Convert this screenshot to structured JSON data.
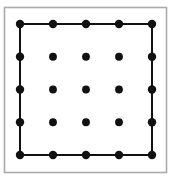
{
  "figure": {
    "canvas": {
      "width": 171,
      "height": 180,
      "background": "#ffffff"
    },
    "outer_frame": {
      "name": "outer-frame",
      "x": 4.5,
      "y": 7.5,
      "width": 162,
      "height": 165,
      "stroke": "#aaaaaa",
      "stroke_width": 1.6,
      "fill": "#ffffff"
    },
    "grid": {
      "rows": 5,
      "cols": 5,
      "x_start": 20,
      "y_start": 24,
      "x_spacing": 33,
      "y_spacing": 32.75,
      "node_count": 25,
      "boundary_node_count": 16,
      "interior_node_count": 9
    },
    "node_style": {
      "radius": 4.2,
      "interior_radius": 3.9,
      "fill": "#111111",
      "stroke": "none"
    },
    "edge_style": {
      "stroke": "#111111",
      "stroke_width": 2.0,
      "description": "perimeter cycle only"
    },
    "nodes": [
      {
        "id": "n-0-0",
        "row": 0,
        "col": 0,
        "x": 20,
        "y": 24,
        "boundary": true
      },
      {
        "id": "n-0-1",
        "row": 0,
        "col": 1,
        "x": 53,
        "y": 24,
        "boundary": true
      },
      {
        "id": "n-0-2",
        "row": 0,
        "col": 2,
        "x": 86,
        "y": 24,
        "boundary": true
      },
      {
        "id": "n-0-3",
        "row": 0,
        "col": 3,
        "x": 119,
        "y": 24,
        "boundary": true
      },
      {
        "id": "n-0-4",
        "row": 0,
        "col": 4,
        "x": 152,
        "y": 24,
        "boundary": true
      },
      {
        "id": "n-1-0",
        "row": 1,
        "col": 0,
        "x": 20,
        "y": 56.75,
        "boundary": true
      },
      {
        "id": "n-1-1",
        "row": 1,
        "col": 1,
        "x": 53,
        "y": 56.75,
        "boundary": false
      },
      {
        "id": "n-1-2",
        "row": 1,
        "col": 2,
        "x": 86,
        "y": 56.75,
        "boundary": false
      },
      {
        "id": "n-1-3",
        "row": 1,
        "col": 3,
        "x": 119,
        "y": 56.75,
        "boundary": false
      },
      {
        "id": "n-1-4",
        "row": 1,
        "col": 4,
        "x": 152,
        "y": 56.75,
        "boundary": true
      },
      {
        "id": "n-2-0",
        "row": 2,
        "col": 0,
        "x": 20,
        "y": 89.5,
        "boundary": true
      },
      {
        "id": "n-2-1",
        "row": 2,
        "col": 1,
        "x": 53,
        "y": 89.5,
        "boundary": false
      },
      {
        "id": "n-2-2",
        "row": 2,
        "col": 2,
        "x": 86,
        "y": 89.5,
        "boundary": false
      },
      {
        "id": "n-2-3",
        "row": 2,
        "col": 3,
        "x": 119,
        "y": 89.5,
        "boundary": false
      },
      {
        "id": "n-2-4",
        "row": 2,
        "col": 4,
        "x": 152,
        "y": 89.5,
        "boundary": true
      },
      {
        "id": "n-3-0",
        "row": 3,
        "col": 0,
        "x": 20,
        "y": 122.25,
        "boundary": true
      },
      {
        "id": "n-3-1",
        "row": 3,
        "col": 1,
        "x": 53,
        "y": 122.25,
        "boundary": false
      },
      {
        "id": "n-3-2",
        "row": 3,
        "col": 2,
        "x": 86,
        "y": 122.25,
        "boundary": false
      },
      {
        "id": "n-3-3",
        "row": 3,
        "col": 3,
        "x": 119,
        "y": 122.25,
        "boundary": false
      },
      {
        "id": "n-3-4",
        "row": 3,
        "col": 4,
        "x": 152,
        "y": 122.25,
        "boundary": true
      },
      {
        "id": "n-4-0",
        "row": 4,
        "col": 0,
        "x": 20,
        "y": 155,
        "boundary": true
      },
      {
        "id": "n-4-1",
        "row": 4,
        "col": 1,
        "x": 53,
        "y": 155,
        "boundary": true
      },
      {
        "id": "n-4-2",
        "row": 4,
        "col": 2,
        "x": 86,
        "y": 155,
        "boundary": true
      },
      {
        "id": "n-4-3",
        "row": 4,
        "col": 3,
        "x": 119,
        "y": 155,
        "boundary": true
      },
      {
        "id": "n-4-4",
        "row": 4,
        "col": 4,
        "x": 152,
        "y": 155,
        "boundary": true
      }
    ],
    "edges": [
      {
        "id": "e-top",
        "from": "n-0-0",
        "to": "n-0-4",
        "x1": 20,
        "y1": 24,
        "x2": 152,
        "y2": 24
      },
      {
        "id": "e-right",
        "from": "n-0-4",
        "to": "n-4-4",
        "x1": 152,
        "y1": 24,
        "x2": 152,
        "y2": 155
      },
      {
        "id": "e-bottom",
        "from": "n-4-4",
        "to": "n-4-0",
        "x1": 152,
        "y1": 155,
        "x2": 20,
        "y2": 155
      },
      {
        "id": "e-left",
        "from": "n-4-0",
        "to": "n-0-0",
        "x1": 20,
        "y1": 155,
        "x2": 20,
        "y2": 24
      }
    ]
  }
}
